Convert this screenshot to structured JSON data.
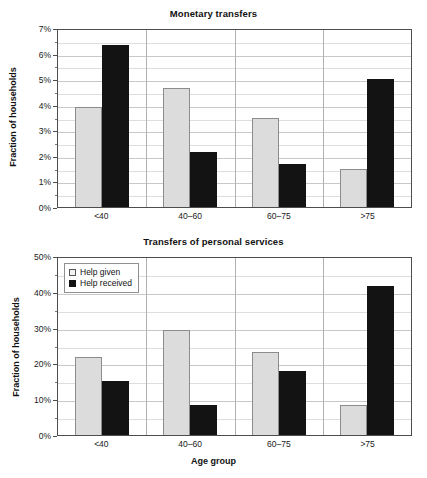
{
  "figure": {
    "xlabel": "Age group",
    "legend": {
      "given_label": "Help given",
      "received_label": "Help received",
      "given_swatch": "light-square-swatch",
      "received_swatch": "black-square-swatch"
    },
    "colors": {
      "help_given": "#dcdcdc",
      "help_given_border": "#8c8c8c",
      "help_received": "#131313",
      "gridline": "#c8c8c8",
      "axis": "#4d4d4d",
      "background": "#ffffff"
    }
  },
  "chart_data": [
    {
      "type": "bar",
      "title": "Monetary transfers",
      "xlabel": "",
      "ylabel": "Fraction of households",
      "categories": [
        "<40",
        "40–60",
        "60–75",
        ">75"
      ],
      "series": [
        {
          "name": "Help given",
          "values": [
            3.9,
            4.65,
            3.5,
            1.5
          ]
        },
        {
          "name": "Help received",
          "values": [
            6.35,
            2.15,
            1.7,
            5.0
          ]
        }
      ],
      "ylim": [
        0,
        7
      ],
      "yticks": [
        0,
        1,
        2,
        3,
        4,
        5,
        6,
        7
      ],
      "ytick_labels": [
        "0%",
        "1%",
        "2%",
        "3%",
        "4%",
        "5%",
        "6%",
        "7%"
      ],
      "yminor_step": 0.5,
      "grid": true,
      "legend_position": "none"
    },
    {
      "type": "bar",
      "title": "Transfers of personal services",
      "xlabel": "Age group",
      "ylabel": "Fraction of households",
      "categories": [
        "<40",
        "40–60",
        "60–75",
        ">75"
      ],
      "series": [
        {
          "name": "Help given",
          "values": [
            21.7,
            29.3,
            23.1,
            8.4
          ]
        },
        {
          "name": "Help received",
          "values": [
            15.2,
            8.3,
            17.9,
            41.7
          ]
        }
      ],
      "ylim": [
        0,
        50
      ],
      "yticks": [
        0,
        10,
        20,
        30,
        40,
        50
      ],
      "ytick_labels": [
        "0%",
        "10%",
        "20%",
        "30%",
        "40%",
        "50%"
      ],
      "yminor_step": 5,
      "grid": true,
      "legend_position": "upper-left"
    }
  ]
}
